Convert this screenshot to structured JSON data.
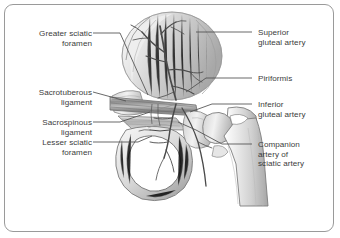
{
  "figure": {
    "style": "grayscale medical illustration with leader-line labels",
    "border_color": "#9a9a9a",
    "text_color": "#3c3c3c",
    "background_color": "#ffffff"
  },
  "labels_left": [
    {
      "id": "greater-sciatic-foramen",
      "line1": "Greater sciatic",
      "line2": "foramen"
    },
    {
      "id": "sacrotuberous-ligament",
      "line1": "Sacrotuberous",
      "line2": "ligament"
    },
    {
      "id": "sacrospinous-ligament",
      "line1": "Sacrospinous",
      "line2": "ligament"
    },
    {
      "id": "lesser-sciatic-foramen",
      "line1": "Lesser sciatic",
      "line2": "foramen"
    }
  ],
  "labels_right": [
    {
      "id": "superior-gluteal-artery",
      "line1": "Superior",
      "line2": "gluteal artery"
    },
    {
      "id": "piriformis",
      "line1": "Piriformis",
      "line2": ""
    },
    {
      "id": "inferior-gluteal-artery",
      "line1": "Inferior",
      "line2": "gluteal artery"
    },
    {
      "id": "companion-artery-of-sciatic-artery",
      "line1": "Companion",
      "line2": "artery of",
      "line3": "sciatic artery"
    }
  ],
  "anatomy_parts": [
    "ilium",
    "sacrum",
    "ischium",
    "pubis",
    "obturator-foramen",
    "femur-head",
    "femur-neck",
    "greater-trochanter",
    "lesser-trochanter",
    "femoral-shaft",
    "sacrotuberous-ligament-band",
    "sacrospinous-ligament-band",
    "superior-gluteal-artery-branches",
    "inferior-gluteal-artery-branches",
    "companion-artery-branch"
  ]
}
